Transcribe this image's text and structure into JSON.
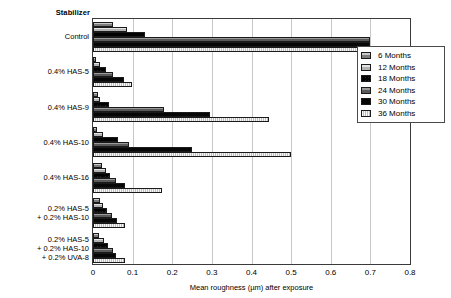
{
  "chart_data": {
    "type": "bar",
    "orientation": "horizontal",
    "title": "",
    "category_axis_title": "Stabilizer",
    "xlabel": "Mean roughness  (µm)  after exposure",
    "ylabel": "",
    "xlim": [
      0,
      0.8
    ],
    "xticks": [
      "0",
      "0.1",
      "0.2",
      "0.3",
      "0.4",
      "0.5",
      "0.6",
      "0.7",
      "0.8"
    ],
    "xtick_values": [
      0,
      0.1,
      0.2,
      0.3,
      0.4,
      0.5,
      0.6,
      0.7,
      0.8
    ],
    "grid": "vertical",
    "legend_position": "upper-right",
    "categories": [
      [
        "Control"
      ],
      [
        "0.4% HAS-5"
      ],
      [
        "0.4% HAS-9"
      ],
      [
        "0.4% HAS-10"
      ],
      [
        "0.4% HAS-16"
      ],
      [
        "0.2% HAS-5",
        "+ 0.2% HAS-10"
      ],
      [
        "0.2% HAS-5",
        "+ 0.2% HAS-10",
        "+ 0.2% UVA-8"
      ]
    ],
    "series": [
      {
        "name": "6 Months",
        "swatch": "#8f8f8f",
        "values": [
          0.05,
          0.008,
          0.012,
          0.01,
          0.022,
          0.017,
          0.015
        ]
      },
      {
        "name": "12 Months",
        "swatch": "#c6c6c6",
        "values": [
          0.085,
          0.018,
          0.018,
          0.025,
          0.032,
          0.026,
          0.028
        ]
      },
      {
        "name": "18 Months",
        "swatch": "#2b2b2b",
        "values": [
          0.13,
          0.033,
          0.04,
          0.062,
          0.043,
          0.035,
          0.038
        ]
      },
      {
        "name": "24 Months",
        "swatch": "#6e6e6e",
        "values": [
          0.7,
          0.05,
          0.18,
          0.09,
          0.058,
          0.048,
          0.05
        ]
      },
      {
        "name": "30 Months",
        "swatch": "#070707",
        "values": [
          0.7,
          0.078,
          0.295,
          0.25,
          0.082,
          0.06,
          0.058
        ]
      },
      {
        "name": "36 Months",
        "swatch": "#d8d8d8",
        "values": [
          0.695,
          0.098,
          0.445,
          0.5,
          0.175,
          0.08,
          0.08
        ]
      }
    ]
  },
  "legend": {
    "items": [
      {
        "label": "6 Months"
      },
      {
        "label": "12 Months"
      },
      {
        "label": "18 Months"
      },
      {
        "label": "24 Months"
      },
      {
        "label": "30 Months"
      },
      {
        "label": "36 Months"
      }
    ]
  }
}
